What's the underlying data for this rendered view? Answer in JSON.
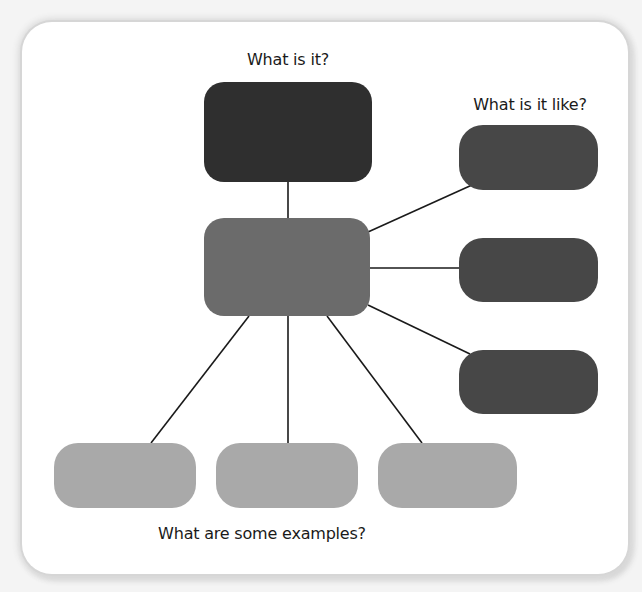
{
  "diagram": {
    "type": "concept-definition-map",
    "labels": {
      "definition": "What is it?",
      "properties": "What is it like?",
      "examples": "What are some examples?"
    },
    "colors": {
      "definition_box": "#2f2f2f",
      "term_box": "#6b6b6b",
      "property_box": "#474747",
      "example_box": "#a9a9a9",
      "connector": "#1a1a1a",
      "card_background": "#ffffff"
    },
    "nodes": {
      "definition": {
        "text": ""
      },
      "term": {
        "text": ""
      },
      "properties": [
        {
          "text": ""
        },
        {
          "text": ""
        },
        {
          "text": ""
        }
      ],
      "examples": [
        {
          "text": ""
        },
        {
          "text": ""
        },
        {
          "text": ""
        }
      ]
    }
  }
}
